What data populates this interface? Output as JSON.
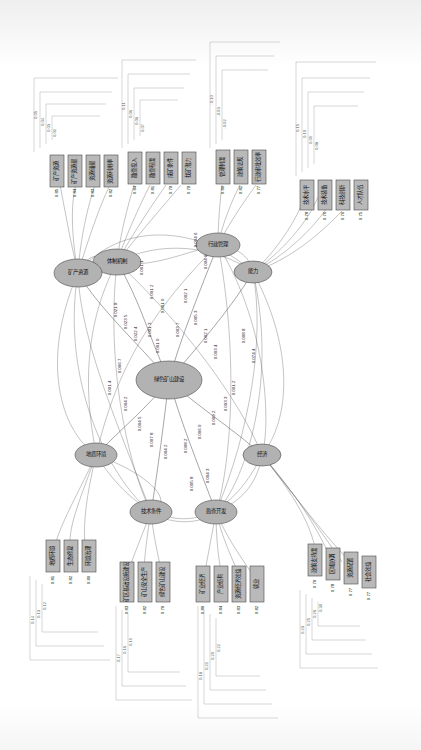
{
  "figure": {
    "type": "sem-path-diagram",
    "orientation": "rotated-90",
    "language": "zh-CN",
    "node_fill": "#b9b9b9",
    "node_stroke": "#4a4a4a",
    "edge_color": "#3a3a3a"
  },
  "latent_nodes": [
    {
      "id": "L1",
      "label": "体制机制",
      "cx": 117,
      "cy": 262
    },
    {
      "id": "L2",
      "label": "行政管理",
      "cx": 218,
      "cy": 245
    },
    {
      "id": "L3",
      "label": "能力",
      "cx": 253,
      "cy": 272
    },
    {
      "id": "L4",
      "label": "矿产资源",
      "cx": 78,
      "cy": 273
    },
    {
      "id": "L5",
      "label": "绿色矿山建设",
      "cx": 169,
      "cy": 380
    },
    {
      "id": "L6",
      "label": "地质环境",
      "cx": 96,
      "cy": 455
    },
    {
      "id": "L7",
      "label": "经济",
      "cx": 262,
      "cy": 455
    },
    {
      "id": "L8",
      "label": "技术条件",
      "cx": 151,
      "cy": 512
    },
    {
      "id": "L9",
      "label": "勘查开发",
      "cx": 216,
      "cy": 512
    }
  ],
  "observed_blocks": [
    {
      "block": "B1",
      "items": [
        {
          "label": "矿产资源",
          "value": "0.85"
        },
        {
          "label": "矿产资源量",
          "value": "0.84"
        },
        {
          "label": "资源储量",
          "value": "0.83"
        },
        {
          "label": "资源利用率",
          "value": "0.82"
        }
      ]
    },
    {
      "block": "B2",
      "items": [
        {
          "label": "勘查投入",
          "value": "0.84"
        },
        {
          "label": "勘查程度",
          "value": "0.81"
        },
        {
          "label": "成矿条件",
          "value": "0.79"
        },
        {
          "label": "找矿潜力",
          "value": "0.79"
        }
      ]
    },
    {
      "block": "B3",
      "items": [
        {
          "label": "管理制度",
          "value": "0.80"
        },
        {
          "label": "政策法规",
          "value": "0.82"
        },
        {
          "label": "行政审批效率",
          "value": "0.77"
        }
      ]
    },
    {
      "block": "B4",
      "items": [
        {
          "label": "技术水平",
          "value": "0.78"
        },
        {
          "label": "技术装备",
          "value": "0.76"
        },
        {
          "label": "科技创新",
          "value": "0.76"
        },
        {
          "label": "人才队伍",
          "value": "0.75"
        }
      ]
    },
    {
      "block": "B5",
      "items": [
        {
          "label": "地质环境",
          "value": "0.81"
        },
        {
          "label": "生态修复",
          "value": "0.82"
        },
        {
          "label": "环境治理",
          "value": "0.80"
        }
      ]
    },
    {
      "block": "B6",
      "items": [
        {
          "label": "矿区基础设施建设",
          "value": "0.83"
        },
        {
          "label": "矿山安全生产",
          "value": "0.82"
        },
        {
          "label": "绿色矿山建设",
          "value": "0.79"
        }
      ]
    },
    {
      "block": "B7",
      "items": [
        {
          "label": "矿业经济",
          "value": "0.89"
        },
        {
          "label": "产业结构",
          "value": "0.84"
        },
        {
          "label": "资源经济效益",
          "value": "0.83"
        },
        {
          "label": "就业",
          "value": "0.82"
        }
      ]
    },
    {
      "block": "B8",
      "items": [
        {
          "label": "政策支持度",
          "value": "0.79"
        },
        {
          "label": "区域协调",
          "value": "0.78"
        },
        {
          "label": "资源配置",
          "value": "0.77"
        },
        {
          "label": "社会效益",
          "value": "0.77"
        }
      ]
    }
  ],
  "path_coefficients": [
    "0.004 6",
    "0.004 9",
    "0.001 1",
    "0.001 2",
    "0.001 0",
    "0.002 1",
    "0.021 8",
    "0.023 5",
    "0.022 4",
    "0.001 3",
    "0.001 0",
    "0.003 7",
    "0.005 3",
    "0.002 1",
    "0.003 4",
    "0.006 7",
    "0.001 4",
    "0.004 2",
    "0.004 5",
    "0.007 8",
    "0.004 2",
    "0.008 2",
    "0.006 0",
    "0.009 2",
    "0.003 3",
    "0.001 2",
    "0.004 3",
    "0.005 8",
    "0.008 8",
    "0.074 4"
  ],
  "error_values": [
    "0.05",
    "0.04",
    "0.03",
    "0.02",
    "0.11",
    "0.06",
    "0.10",
    "0.09",
    "0.08",
    "0.07",
    "0.13",
    "0.12",
    "0.15",
    "0.14",
    "0.17",
    "0.16",
    "0.19",
    "0.18",
    "0.21",
    "0.20",
    "-0.10",
    "-0.03",
    "-0.02",
    "-0.01",
    "0.27",
    "0.22",
    "0.23",
    "0.25",
    "0.26",
    "0.30"
  ],
  "caption": ""
}
